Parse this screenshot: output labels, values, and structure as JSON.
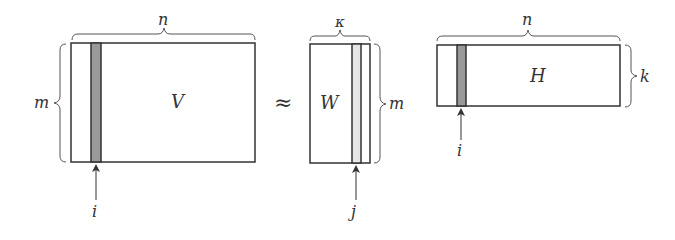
{
  "diagram": {
    "operator": "≈",
    "colors": {
      "stroke": "#333333",
      "brace": "#555555",
      "stripe_dark": "#999999",
      "stripe_light": "#e6e6e6",
      "background": "#ffffff"
    },
    "matrices": {
      "V": {
        "label": "V",
        "width_label": "n",
        "height_label": "m",
        "column_marker": "i"
      },
      "W": {
        "label": "W",
        "width_label": "κ",
        "height_label": "m",
        "column_marker": "j"
      },
      "H": {
        "label": "H",
        "width_label": "n",
        "height_label": "k",
        "column_marker": "i"
      }
    }
  }
}
